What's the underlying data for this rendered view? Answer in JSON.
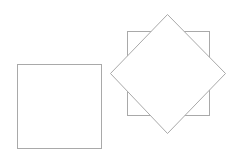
{
  "canvas": {
    "width": 239,
    "height": 161,
    "background": "#ffffff"
  },
  "stroke_color": "#a9a9a9",
  "shapes": [
    {
      "id": "left-square",
      "type": "square",
      "x": 17.5,
      "y": 64.5,
      "width": 84,
      "height": 84,
      "rotation": 0
    },
    {
      "id": "back-square",
      "type": "square",
      "x": 127.5,
      "y": 31.5,
      "width": 82,
      "height": 84,
      "rotation": 0
    },
    {
      "id": "diamond",
      "type": "rotated-square",
      "points": [
        [
          167.5,
          14.5
        ],
        [
          225.5,
          73.5
        ],
        [
          167.5,
          133.5
        ],
        [
          110.5,
          73.5
        ]
      ],
      "rotation": 45
    }
  ]
}
